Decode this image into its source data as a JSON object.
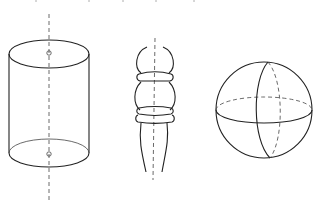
{
  "diagram": {
    "figures": [
      {
        "name": "cylinder",
        "axis": "vertical dashed axis through centers of top and bottom faces"
      },
      {
        "name": "turned-spindle",
        "axis": "vertical dashed axis through center"
      },
      {
        "name": "sphere",
        "axis": "meridian and dashed equator"
      }
    ],
    "colors": {
      "line": "#222222",
      "background": "#ffffff"
    }
  }
}
